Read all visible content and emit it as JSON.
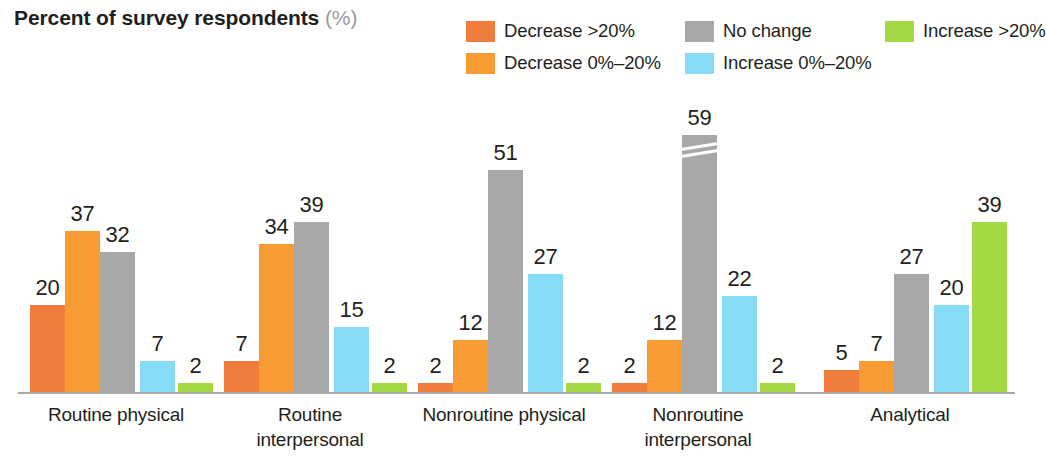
{
  "title": {
    "main": "Percent of survey respondents",
    "unit": "(%)"
  },
  "legend": [
    {
      "label": "Decrease >20%",
      "color": "#ef7d3b"
    },
    {
      "label": "Decrease 0%–20%",
      "color": "#f89b34"
    },
    {
      "label": "No change",
      "color": "#a8a8a8"
    },
    {
      "label": "Increase 0%–20%",
      "color": "#87dcf5"
    },
    {
      "label": "Increase >20%",
      "color": "#a5d943"
    }
  ],
  "chart_data": {
    "type": "bar",
    "title": "Percent of survey respondents (%)",
    "xlabel": "",
    "ylabel": "Percent of survey respondents (%)",
    "ylim": [
      0,
      62
    ],
    "grid": false,
    "legend_position": "top-right",
    "axis_break": {
      "group": "Nonroutine interpersonal",
      "series": "No change",
      "value": 59
    },
    "categories": [
      "Routine physical",
      "Routine interpersonal",
      "Nonroutine physical",
      "Nonroutine interpersonal",
      "Analytical"
    ],
    "category_lines": [
      [
        "Routine physical"
      ],
      [
        "Routine",
        "interpersonal"
      ],
      [
        "Nonroutine physical"
      ],
      [
        "Nonroutine",
        "interpersonal"
      ],
      [
        "Analytical"
      ]
    ],
    "series": [
      {
        "name": "Decrease >20%",
        "color": "#ef7d3b",
        "values": [
          20,
          7,
          2,
          2,
          5
        ]
      },
      {
        "name": "Decrease 0%–20%",
        "color": "#f89b34",
        "values": [
          37,
          34,
          12,
          12,
          7
        ]
      },
      {
        "name": "No change",
        "color": "#a8a8a8",
        "values": [
          32,
          39,
          51,
          59,
          27
        ]
      },
      {
        "name": "Increase 0%–20%",
        "color": "#87dcf5",
        "values": [
          7,
          15,
          27,
          22,
          20
        ]
      },
      {
        "name": "Increase >20%",
        "color": "#a5d943",
        "values": [
          2,
          2,
          2,
          2,
          39
        ]
      }
    ]
  },
  "layout": {
    "group_left": [
      18,
      212,
      406,
      600,
      812
    ],
    "group_width": 196,
    "slot_offsets": [
      12,
      47,
      82,
      122,
      160
    ],
    "px_per_unit": 4.36,
    "baseline_top": 300
  }
}
